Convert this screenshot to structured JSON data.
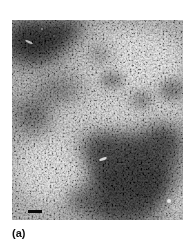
{
  "figure": {
    "panel_label": "(a)",
    "image": {
      "type": "grayscale micrograph",
      "description": "Mottled light and dark speckled texture; dark region top-left corner and large dark region lower-right",
      "has_scale_bar": true
    },
    "colors": {
      "background": "#ffffff",
      "dark_region": "#0a0a0a",
      "light_region": "#e8e8e8",
      "scale_bar": "#0a0a0a"
    }
  }
}
